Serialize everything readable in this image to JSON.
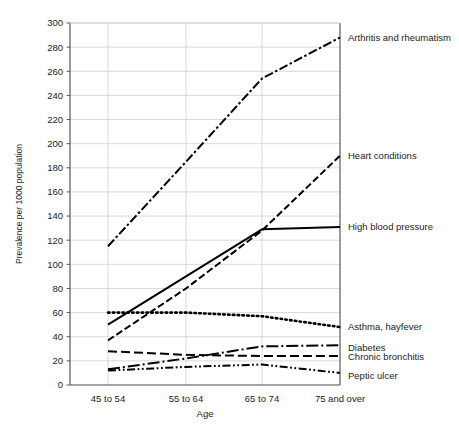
{
  "chart_data": {
    "type": "line",
    "title": "",
    "xlabel": "Age",
    "ylabel": "Prevalence per 1000 population",
    "categories": [
      "45 to 54",
      "55 to 64",
      "65 to 74",
      "75 and over"
    ],
    "ylim": [
      0,
      300
    ],
    "ytick_step": 20,
    "yticks": [
      0,
      20,
      40,
      60,
      80,
      100,
      120,
      140,
      160,
      180,
      200,
      220,
      240,
      260,
      280,
      300
    ],
    "grid": "horizontal-and-vertical",
    "legend_position": "right-inline-labels",
    "series": [
      {
        "name": "Arthritis and rheumatism",
        "values": [
          115,
          185,
          254,
          288
        ],
        "style": "dash-dot",
        "color": "#000000"
      },
      {
        "name": "Heart conditions",
        "values": [
          37,
          80,
          128,
          190
        ],
        "style": "dashed",
        "color": "#000000"
      },
      {
        "name": "High blood pressure",
        "values": [
          50,
          90,
          129,
          131
        ],
        "style": "solid",
        "color": "#000000"
      },
      {
        "name": "Asthma, hayfever",
        "values": [
          60,
          60,
          57,
          48
        ],
        "style": "dotted",
        "color": "#000000"
      },
      {
        "name": "Diabetes",
        "values": [
          13,
          22,
          32,
          33
        ],
        "style": "long-dash-dot",
        "color": "#000000"
      },
      {
        "name": "Chronic bronchitis",
        "values": [
          28,
          25,
          24,
          24
        ],
        "style": "medium-dash",
        "color": "#000000"
      },
      {
        "name": "Peptic ulcer",
        "values": [
          12,
          15,
          17,
          10
        ],
        "style": "dash-dot-dot",
        "color": "#000000"
      }
    ]
  },
  "axes": {
    "y_title": "Prevalence per 1000 population",
    "x_title": "Age",
    "y_tick_labels": [
      "300",
      "280",
      "260",
      "240",
      "220",
      "200",
      "180",
      "160",
      "140",
      "120",
      "100",
      "80",
      "60",
      "40",
      "20",
      "0"
    ],
    "x_tick_labels": [
      "45 to 54",
      "55 to 64",
      "65 to 74",
      "75 and over"
    ]
  },
  "series_labels": {
    "arthritis": "Arthritis and rheumatism",
    "heart": "Heart conditions",
    "blood_pressure": "High blood pressure",
    "asthma": "Asthma, hayfever",
    "diabetes": "Diabetes",
    "bronchitis": "Chronic bronchitis",
    "peptic_ulcer": "Peptic ulcer"
  },
  "colors": {
    "line": "#000000",
    "grid": "#cfcfcf",
    "axis": "#4a4a4a",
    "text": "#232323",
    "background": "#ffffff"
  }
}
